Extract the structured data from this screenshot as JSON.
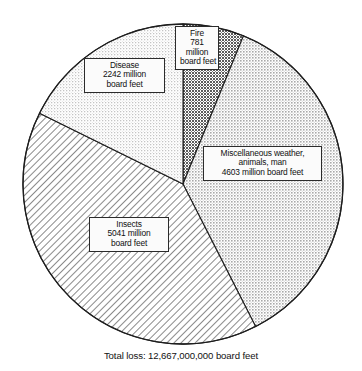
{
  "chart_data": {
    "type": "pie",
    "title": "",
    "subtitle": "",
    "xlabel": "",
    "ylabel": "",
    "unit": "million board feet",
    "legend_position": "none",
    "grid": false,
    "start_angle_deg": 0,
    "direction": "clockwise",
    "center": [
      183,
      184
    ],
    "radius": 160,
    "total_label": "Total loss: 12,667,000,000 board feet",
    "total_value": 12667000000,
    "categories": [
      "Fire",
      "Miscellaneous weather, animals, man",
      "Insects",
      "Disease"
    ],
    "values": [
      781,
      4603,
      5041,
      2242
    ],
    "slices": [
      {
        "key": "fire",
        "name": "Fire",
        "value": 781,
        "share_deg": 22.2,
        "start_deg": 0,
        "end_deg": 22.2,
        "fill": "#8f8f8f",
        "pattern": "dense-stipple",
        "label_lines": [
          "Fire",
          "781",
          "million",
          "board feet"
        ]
      },
      {
        "key": "misc",
        "name": "Miscellaneous weather, animals, man",
        "value": 4603,
        "share_deg": 130.8,
        "start_deg": 22.2,
        "end_deg": 153.0,
        "fill": "#c8c8c8",
        "pattern": "medium-stipple",
        "label_lines": [
          "Miscellaneous weather,",
          "animals, man",
          "4603 million board feet"
        ]
      },
      {
        "key": "insects",
        "name": "Insects",
        "value": 5041,
        "share_deg": 143.3,
        "start_deg": 153.0,
        "end_deg": 296.3,
        "fill": "#ffffff",
        "pattern": "diagonal-hatch",
        "label_lines": [
          "Insects",
          "5041 million",
          "board feet"
        ]
      },
      {
        "key": "disease",
        "name": "Disease",
        "value": 2242,
        "share_deg": 63.7,
        "start_deg": 296.3,
        "end_deg": 360.0,
        "fill": "#ececec",
        "pattern": "light-stipple",
        "label_lines": [
          "Disease",
          "2242 million",
          "board feet"
        ]
      }
    ]
  },
  "labels": {
    "fire": {
      "line1": "Fire",
      "line2": "781",
      "line3": "million",
      "line4": "board feet"
    },
    "disease": {
      "line1": "Disease",
      "line2": "2242 million",
      "line3": "board feet"
    },
    "misc": {
      "line1": "Miscellaneous weather,",
      "line2": "animals, man",
      "line3": "4603 million board feet"
    },
    "insects": {
      "line1": "Insects",
      "line2": "5041 million",
      "line3": "board feet"
    }
  },
  "caption": {
    "total": "Total loss: 12,667,000,000 board feet"
  },
  "colors": {
    "outline": "#1e1e1e",
    "background": "#ffffff",
    "text": "#101010",
    "label_box_fill": "#fbfbfb"
  }
}
